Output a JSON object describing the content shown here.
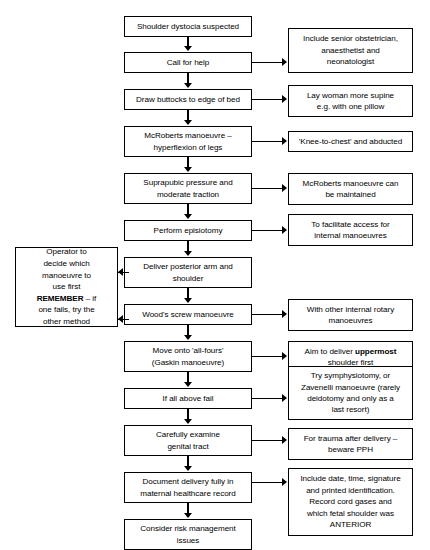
{
  "document": {
    "type": "clinical-algorithm-flowchart",
    "topic": "Shoulder dystocia management algorithm",
    "colors": {
      "line": "#000000",
      "background": "#ffffff",
      "text": "#000000"
    }
  },
  "main_steps": [
    {
      "id": "step-1",
      "label": "Shoulder dystocia suspected"
    },
    {
      "id": "step-2",
      "label": "Call for help"
    },
    {
      "id": "step-3",
      "label": "Draw buttocks to edge of bed"
    },
    {
      "id": "step-4",
      "label": "McRoberts manoeuvre –\nhyperflexion of legs"
    },
    {
      "id": "step-5",
      "label": "Suprapubic pressure and\nmoderate traction"
    },
    {
      "id": "step-6",
      "label": "Perform episiotomy"
    },
    {
      "id": "step-7",
      "label": "Deliver posterior arm and\nshoulder"
    },
    {
      "id": "step-8",
      "label": "Wood's screw manoeuvre"
    },
    {
      "id": "step-9",
      "label": "Move onto 'all-fours'\n(Gaskin manoeuvre)"
    },
    {
      "id": "step-10",
      "label": "If all above fail"
    },
    {
      "id": "step-11",
      "label": "Carefully examine\ngenital tract"
    },
    {
      "id": "step-12",
      "label": "Document delivery fully in\nmaternal healthcare record"
    },
    {
      "id": "step-13",
      "label": "Consider risk management\nissues"
    }
  ],
  "notes": [
    {
      "id": "note-1",
      "for": "step-2",
      "label": "Include senior obstetrician,\nanaesthetist and\nneonatologist"
    },
    {
      "id": "note-2",
      "for": "step-3",
      "label": "Lay woman more supine\ne.g. with one pillow"
    },
    {
      "id": "note-3",
      "for": "step-4",
      "label": "'Knee-to-chest' and abducted"
    },
    {
      "id": "note-4",
      "for": "step-5",
      "label": "McRoberts manoeuvre can\nbe maintained"
    },
    {
      "id": "note-5",
      "for": "step-6",
      "label": "To facilitate access for\ninternal manoeuvres"
    },
    {
      "id": "note-6",
      "for": "step-8",
      "label": "With other internal rotary\nmanoeuvres"
    },
    {
      "id": "note-7",
      "for": "step-9",
      "label_pre": "Aim to deliver ",
      "label_bold": "uppermost",
      "label_post": "\nshoulder first"
    },
    {
      "id": "note-8",
      "for": "step-10",
      "label": "Try symphysiotomy, or\nZavenelli manoeuvre (rarely\ndeidotomy and only as a\nlast resort)"
    },
    {
      "id": "note-9",
      "for": "step-11",
      "label": "For trauma after delivery –\nbeware PPH"
    },
    {
      "id": "note-10",
      "for": "step-12",
      "label": "Include date, time, signature\nand printed identification.\nRecord cord gases and\nwhich fetal shoulder was\nANTERIOR"
    }
  ],
  "side_note": {
    "id": "side-note-operator",
    "line1": "Operator to",
    "line2": "decide which",
    "line3": "manoeuvre to",
    "line4": "use first",
    "bold": "REMEMBER",
    "after_bold": " – if",
    "line5": "one fails, try the",
    "line6": "other method",
    "points_to": [
      "step-7",
      "step-8"
    ]
  }
}
